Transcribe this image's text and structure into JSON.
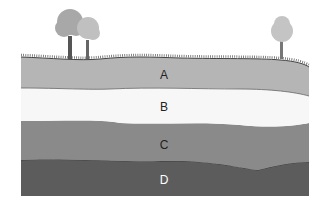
{
  "diagram": {
    "layers": [
      {
        "id": "A",
        "label": "A",
        "color": "#b5b5b5",
        "text_color": "#222222"
      },
      {
        "id": "B",
        "label": "B",
        "color": "#f7f7f7",
        "text_color": "#222222"
      },
      {
        "id": "C",
        "label": "C",
        "color": "#8a8a8a",
        "text_color": "#222222"
      },
      {
        "id": "D",
        "label": "D",
        "color": "#5c5c5c",
        "text_color": "#ffffff"
      }
    ],
    "trees": [
      {
        "name": "tree-left-large",
        "x": 70
      },
      {
        "name": "tree-left-small",
        "x": 88
      },
      {
        "name": "tree-right",
        "x": 282
      }
    ]
  }
}
